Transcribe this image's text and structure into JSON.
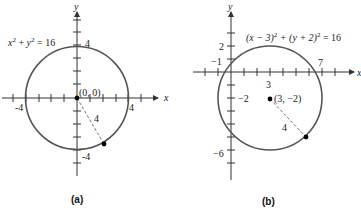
{
  "panels": [
    {
      "id": "a",
      "caption": "(a)",
      "equation_parts": {
        "x": "x",
        "sq1": "2",
        "plus": " + ",
        "y": "y",
        "sq2": "2",
        "eq": " =  16"
      },
      "center_label": "(0, 0)",
      "radius_label": "4",
      "axis_x_label": "x",
      "axis_y_label": "y",
      "tick_labels": {
        "y_top": "4",
        "x_right": "4",
        "x_left": "-4",
        "y_bottom": "-4"
      },
      "circle": {
        "h": 0,
        "k": 0,
        "r": 4
      }
    },
    {
      "id": "b",
      "caption": "(b)",
      "equation": "(x - 3)2 + (y + 2)2 = 16",
      "equation_parts": {
        "p1": "(x − 3)",
        "sq1": "2",
        "p2": " + (y + 2)",
        "sq2": "2",
        "eq": " =  16"
      },
      "center_label": "(3, −2)",
      "radius_label": "4",
      "axis_x_label": "x",
      "axis_y_label": "y",
      "tick_labels": {
        "y_2": "2",
        "x_neg1": "−1",
        "x_7": "7",
        "x_3": "3",
        "y_neg2": "−2",
        "y_neg6": "−6"
      },
      "circle": {
        "h": 3,
        "k": -2,
        "r": 4
      }
    }
  ],
  "colors": {
    "circle": "#555555",
    "axis": "#333333",
    "point": "#000000",
    "radius_line": "#666666"
  }
}
